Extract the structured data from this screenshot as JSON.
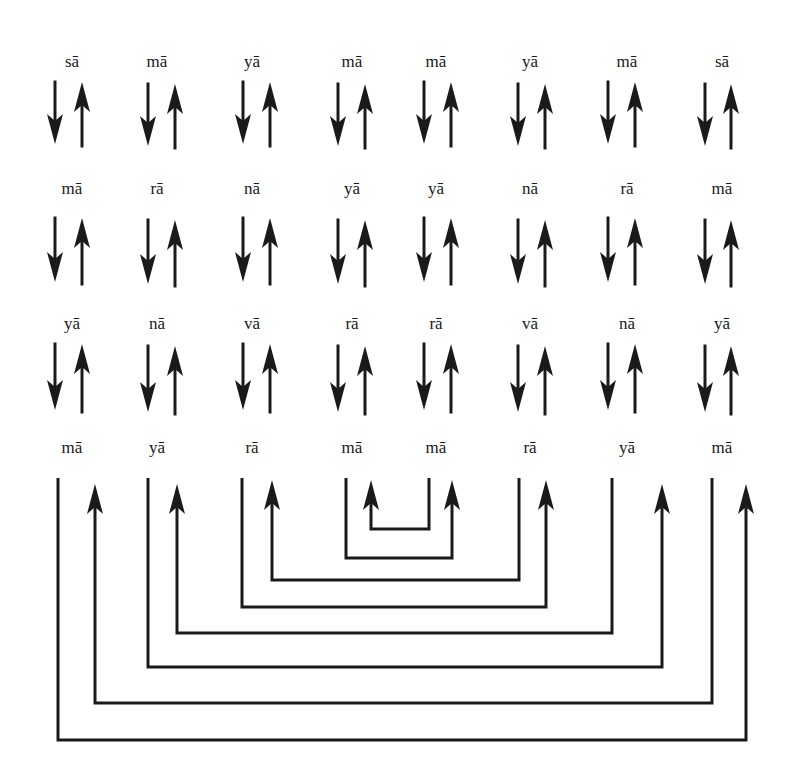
{
  "rows": [
    {
      "y_label": 66,
      "arrow_top": 82,
      "arrow_bottom": 144,
      "syllables": [
        "sā",
        "mā",
        "yā",
        "mā",
        "mā",
        "yā",
        "mā",
        "sā"
      ]
    },
    {
      "y_label": 193,
      "arrow_top": 218,
      "arrow_bottom": 282,
      "syllables": [
        "mā",
        "rā",
        "nā",
        "yā",
        "yā",
        "nā",
        "rā",
        "mā"
      ]
    },
    {
      "y_label": 328,
      "arrow_top": 344,
      "arrow_bottom": 410,
      "syllables": [
        "yā",
        "nā",
        "vā",
        "rā",
        "rā",
        "vā",
        "nā",
        "yā"
      ]
    },
    {
      "y_label": 452,
      "syllables": [
        "mā",
        "yā",
        "rā",
        "mā",
        "mā",
        "rā",
        "yā",
        "mā"
      ]
    }
  ],
  "columns": {
    "label_x": [
      72,
      157,
      252,
      352,
      436,
      530,
      627,
      722
    ],
    "down_x": [
      55,
      148,
      243,
      338,
      424,
      518,
      608,
      705
    ],
    "up_x": [
      82,
      175,
      270,
      365,
      451,
      545,
      635,
      731
    ]
  },
  "bottom_links": [
    {
      "from_x": 429,
      "to_x": 371,
      "level_y": 529,
      "top_y": 478
    },
    {
      "from_x": 346,
      "to_x": 452,
      "level_y": 558,
      "top_y": 478
    },
    {
      "from_x": 519,
      "to_x": 272,
      "level_y": 580,
      "top_y": 478
    },
    {
      "from_x": 242,
      "to_x": 546,
      "level_y": 607,
      "top_y": 478
    },
    {
      "from_x": 612,
      "to_x": 177,
      "level_y": 633,
      "top_y": 478
    },
    {
      "from_x": 148,
      "to_x": 662,
      "level_y": 667,
      "top_y": 478
    },
    {
      "from_x": 712,
      "to_x": 95,
      "level_y": 703,
      "top_y": 478
    },
    {
      "from_x": 58,
      "to_x": 746,
      "level_y": 740,
      "top_y": 478
    }
  ],
  "colors": {
    "ink": "#1a1a1a",
    "background": "#ffffff"
  }
}
